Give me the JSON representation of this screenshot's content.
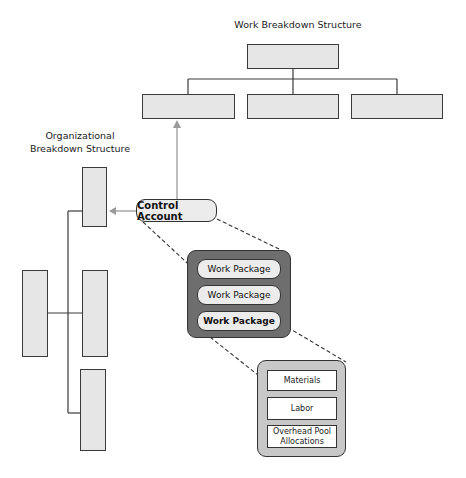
{
  "wbs": {
    "title": "Work Breakdown Structure",
    "top_box": "",
    "child_boxes": [
      "",
      "",
      ""
    ]
  },
  "obs": {
    "title_line1": "Organizational",
    "title_line2": "Breakdown Structure",
    "root_box": "",
    "child_boxes": [
      "",
      "",
      ""
    ]
  },
  "control_account": {
    "label": "Control Account"
  },
  "work_packages": {
    "items": [
      {
        "label": "Work Package",
        "bold": false
      },
      {
        "label": "Work Package",
        "bold": false
      },
      {
        "label": "Work Package",
        "bold": true
      }
    ]
  },
  "cost_elements": {
    "items": [
      {
        "label": "Materials"
      },
      {
        "label": "Labor"
      },
      {
        "label": "Overhead Pool Allocations"
      }
    ],
    "overhead_line1": "Overhead Pool",
    "overhead_line2": "Allocations"
  },
  "colors": {
    "box_fill": "#e6e6e6",
    "wp_container_fill": "#6e6e6e",
    "ce_container_fill": "#c8c8c8",
    "arrow": "#9a9a9a",
    "line": "#3a3a3a"
  }
}
